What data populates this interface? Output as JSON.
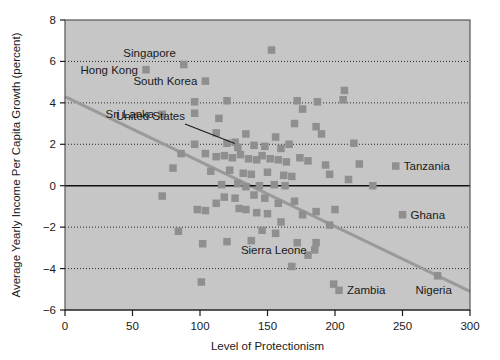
{
  "chart_data": {
    "type": "scatter",
    "title": "",
    "xlabel": "Level of Protectionism",
    "ylabel": "Average Yearly Income Per Capita Growth (percent)",
    "xlim": [
      0,
      300
    ],
    "ylim": [
      -6,
      8
    ],
    "xticks": [
      0,
      50,
      100,
      150,
      200,
      250,
      300
    ],
    "yticks": [
      -6,
      -4,
      -2,
      0,
      2,
      4,
      6,
      8
    ],
    "xtick_labels": [
      "0",
      "50",
      "100",
      "150",
      "200",
      "250",
      "300"
    ],
    "ytick_labels": [
      "−6",
      "−4",
      "−2",
      "0",
      "2",
      "4",
      "6",
      "8"
    ],
    "grid": "horizontal-dotted",
    "zero_line": true,
    "legend": "none",
    "marker": "square",
    "marker_color": "#8f8f8f",
    "plot_background": "#c6c6c6",
    "trendline": {
      "label": "fitted regression line",
      "color": "#9a9a9a",
      "x_start": 0,
      "y_start": 4.3,
      "x_end": 300,
      "y_end": -5.1
    },
    "points": [
      {
        "x": 60,
        "y": 5.6,
        "label": "Hong Kong",
        "label_pos": "left"
      },
      {
        "x": 88,
        "y": 5.85,
        "label": "Singapore",
        "label_pos": "above-left"
      },
      {
        "x": 104,
        "y": 5.05,
        "label": "South Korea",
        "label_pos": "left"
      },
      {
        "x": 72,
        "y": 3.45,
        "label": "Sri Lanka",
        "label_pos": "left"
      },
      {
        "x": 128,
        "y": 1.85,
        "label": "United States",
        "label_pos": "leader"
      },
      {
        "x": 245,
        "y": 0.95,
        "label": "Tanzania",
        "label_pos": "right"
      },
      {
        "x": 250,
        "y": -1.4,
        "label": "Ghana",
        "label_pos": "right"
      },
      {
        "x": 185,
        "y": -3.1,
        "label": "Sierra Leone",
        "label_pos": "left"
      },
      {
        "x": 203,
        "y": -5.05,
        "label": "Zambia",
        "label_pos": "right"
      },
      {
        "x": 276,
        "y": -4.35,
        "label": "Nigeria",
        "label_pos": "below-left"
      },
      {
        "x": 153,
        "y": 6.55,
        "label": ""
      },
      {
        "x": 96,
        "y": 4.05,
        "label": ""
      },
      {
        "x": 120,
        "y": 4.1,
        "label": ""
      },
      {
        "x": 172,
        "y": 4.1,
        "label": ""
      },
      {
        "x": 187,
        "y": 4.05,
        "label": ""
      },
      {
        "x": 207,
        "y": 4.6,
        "label": ""
      },
      {
        "x": 206,
        "y": 4.15,
        "label": ""
      },
      {
        "x": 96,
        "y": 3.5,
        "label": ""
      },
      {
        "x": 114,
        "y": 3.25,
        "label": ""
      },
      {
        "x": 176,
        "y": 3.7,
        "label": ""
      },
      {
        "x": 170,
        "y": 3.0,
        "label": ""
      },
      {
        "x": 186,
        "y": 2.85,
        "label": ""
      },
      {
        "x": 112,
        "y": 2.55,
        "label": ""
      },
      {
        "x": 134,
        "y": 2.5,
        "label": ""
      },
      {
        "x": 156,
        "y": 2.35,
        "label": ""
      },
      {
        "x": 190,
        "y": 2.5,
        "label": ""
      },
      {
        "x": 96,
        "y": 2.0,
        "label": ""
      },
      {
        "x": 120,
        "y": 2.05,
        "label": ""
      },
      {
        "x": 126,
        "y": 2.1,
        "label": ""
      },
      {
        "x": 140,
        "y": 1.95,
        "label": ""
      },
      {
        "x": 148,
        "y": 1.9,
        "label": ""
      },
      {
        "x": 160,
        "y": 1.8,
        "label": ""
      },
      {
        "x": 166,
        "y": 2.0,
        "label": ""
      },
      {
        "x": 214,
        "y": 2.05,
        "label": ""
      },
      {
        "x": 86,
        "y": 1.55,
        "label": ""
      },
      {
        "x": 104,
        "y": 1.55,
        "label": ""
      },
      {
        "x": 112,
        "y": 1.4,
        "label": ""
      },
      {
        "x": 118,
        "y": 1.45,
        "label": ""
      },
      {
        "x": 124,
        "y": 1.35,
        "label": ""
      },
      {
        "x": 130,
        "y": 1.5,
        "label": ""
      },
      {
        "x": 136,
        "y": 1.3,
        "label": ""
      },
      {
        "x": 142,
        "y": 1.25,
        "label": ""
      },
      {
        "x": 146,
        "y": 1.45,
        "label": ""
      },
      {
        "x": 152,
        "y": 1.3,
        "label": ""
      },
      {
        "x": 158,
        "y": 1.25,
        "label": ""
      },
      {
        "x": 164,
        "y": 1.15,
        "label": ""
      },
      {
        "x": 174,
        "y": 1.35,
        "label": ""
      },
      {
        "x": 180,
        "y": 1.2,
        "label": ""
      },
      {
        "x": 193,
        "y": 1.0,
        "label": ""
      },
      {
        "x": 218,
        "y": 1.05,
        "label": ""
      },
      {
        "x": 80,
        "y": 0.85,
        "label": ""
      },
      {
        "x": 108,
        "y": 0.7,
        "label": ""
      },
      {
        "x": 122,
        "y": 0.75,
        "label": ""
      },
      {
        "x": 132,
        "y": 0.6,
        "label": ""
      },
      {
        "x": 138,
        "y": 0.55,
        "label": ""
      },
      {
        "x": 150,
        "y": 0.65,
        "label": ""
      },
      {
        "x": 162,
        "y": 0.5,
        "label": ""
      },
      {
        "x": 168,
        "y": 0.45,
        "label": ""
      },
      {
        "x": 196,
        "y": 0.55,
        "label": ""
      },
      {
        "x": 210,
        "y": 0.3,
        "label": ""
      },
      {
        "x": 116,
        "y": 0.05,
        "label": ""
      },
      {
        "x": 128,
        "y": 0.1,
        "label": ""
      },
      {
        "x": 134,
        "y": -0.05,
        "label": ""
      },
      {
        "x": 144,
        "y": 0.0,
        "label": ""
      },
      {
        "x": 155,
        "y": 0.05,
        "label": ""
      },
      {
        "x": 163,
        "y": 0.0,
        "label": ""
      },
      {
        "x": 228,
        "y": 0.0,
        "label": ""
      },
      {
        "x": 72,
        "y": -0.5,
        "label": ""
      },
      {
        "x": 112,
        "y": -0.85,
        "label": ""
      },
      {
        "x": 118,
        "y": -0.55,
        "label": ""
      },
      {
        "x": 126,
        "y": -0.6,
        "label": ""
      },
      {
        "x": 140,
        "y": -0.45,
        "label": ""
      },
      {
        "x": 148,
        "y": -0.6,
        "label": ""
      },
      {
        "x": 158,
        "y": -0.85,
        "label": ""
      },
      {
        "x": 170,
        "y": -0.75,
        "label": ""
      },
      {
        "x": 98,
        "y": -1.15,
        "label": ""
      },
      {
        "x": 104,
        "y": -1.2,
        "label": ""
      },
      {
        "x": 129,
        "y": -1.1,
        "label": ""
      },
      {
        "x": 134,
        "y": -1.15,
        "label": ""
      },
      {
        "x": 142,
        "y": -1.3,
        "label": ""
      },
      {
        "x": 150,
        "y": -1.35,
        "label": ""
      },
      {
        "x": 176,
        "y": -1.4,
        "label": ""
      },
      {
        "x": 186,
        "y": -1.25,
        "label": ""
      },
      {
        "x": 200,
        "y": -1.15,
        "label": ""
      },
      {
        "x": 160,
        "y": -1.75,
        "label": ""
      },
      {
        "x": 196,
        "y": -1.9,
        "label": ""
      },
      {
        "x": 84,
        "y": -2.2,
        "label": ""
      },
      {
        "x": 146,
        "y": -2.15,
        "label": ""
      },
      {
        "x": 156,
        "y": -2.3,
        "label": ""
      },
      {
        "x": 102,
        "y": -2.8,
        "label": ""
      },
      {
        "x": 120,
        "y": -2.7,
        "label": ""
      },
      {
        "x": 138,
        "y": -2.65,
        "label": ""
      },
      {
        "x": 172,
        "y": -2.75,
        "label": ""
      },
      {
        "x": 186,
        "y": -2.75,
        "label": ""
      },
      {
        "x": 180,
        "y": -3.35,
        "label": ""
      },
      {
        "x": 168,
        "y": -3.9,
        "label": ""
      },
      {
        "x": 101,
        "y": -4.65,
        "label": ""
      },
      {
        "x": 199,
        "y": -4.75,
        "label": ""
      }
    ]
  }
}
